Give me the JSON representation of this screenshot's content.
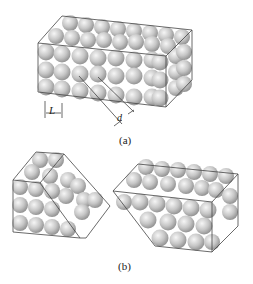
{
  "figure_a": {
    "caption": "(a)",
    "label_L": "L",
    "label_d": "d"
  },
  "figure_b": {
    "caption": "(b)"
  },
  "colors": {
    "sphere_fill": "#c8c8c8",
    "sphere_highlight": "#f4f4f4",
    "sphere_shadow": "#8a8a8a",
    "edge": "#444444"
  }
}
